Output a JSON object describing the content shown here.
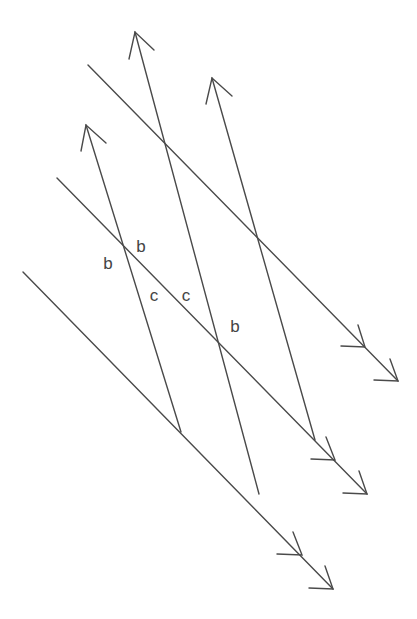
{
  "diagram": {
    "stroke_color": "#4a4a4a",
    "background": "#ffffff",
    "parallel_set_single_arrow": [
      {
        "id": "s1",
        "tip": [
          86,
          125
        ],
        "end": [
          181,
          432
        ]
      },
      {
        "id": "s2",
        "tip": [
          135,
          32
        ],
        "end": [
          259,
          494
        ]
      },
      {
        "id": "s3",
        "tip": [
          212,
          78
        ],
        "end": [
          315,
          440
        ]
      }
    ],
    "parallel_set_double_arrow": [
      {
        "id": "d1",
        "start": [
          88,
          65
        ],
        "end": [
          398,
          381
        ]
      },
      {
        "id": "d2",
        "start": [
          57,
          178
        ],
        "end": [
          367,
          494
        ]
      },
      {
        "id": "d3",
        "start": [
          23,
          272
        ],
        "end": [
          333,
          589
        ]
      }
    ],
    "labels": [
      {
        "text": "b",
        "x": 108,
        "y": 263
      },
      {
        "text": "b",
        "x": 141,
        "y": 246
      },
      {
        "text": "c",
        "x": 154,
        "y": 295
      },
      {
        "text": "c",
        "x": 186,
        "y": 295
      },
      {
        "text": "b",
        "x": 235,
        "y": 326
      }
    ]
  }
}
